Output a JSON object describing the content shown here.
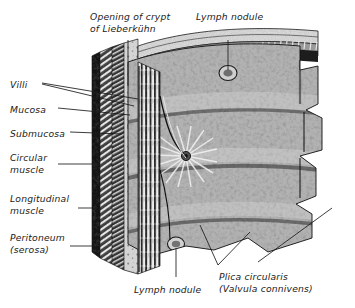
{
  "figure": {
    "kind": "anatomical-illustration",
    "background_color": "#ffffff",
    "ink_color": "#1a1a1a",
    "style": "halftone engraving, grayscale"
  },
  "labels": [
    {
      "id": "opening-of-crypt",
      "lines": [
        "Opening of crypt",
        "of Lieberkühn"
      ],
      "text": "Opening of crypt of Lieberkühn",
      "x": 90,
      "y": 11,
      "align": "left"
    },
    {
      "id": "lymph-nodule-top",
      "lines": [
        "Lymph nodule"
      ],
      "text": "Lymph nodule",
      "x": 196,
      "y": 11,
      "align": "left"
    },
    {
      "id": "villi",
      "lines": [
        "Villi"
      ],
      "text": "Villi",
      "x": 10,
      "y": 79,
      "align": "left"
    },
    {
      "id": "mucosa",
      "lines": [
        "Mucosa"
      ],
      "text": "Mucosa",
      "x": 10,
      "y": 104,
      "align": "left"
    },
    {
      "id": "submucosa",
      "lines": [
        "Submucosa"
      ],
      "text": "Submucosa",
      "x": 10,
      "y": 128,
      "align": "left"
    },
    {
      "id": "circular-muscle",
      "lines": [
        "Circular",
        "muscle"
      ],
      "text": "Circular muscle",
      "x": 10,
      "y": 152,
      "align": "left"
    },
    {
      "id": "longitudinal-muscle",
      "lines": [
        "Longitudinal",
        "muscle"
      ],
      "text": "Longitudinal muscle",
      "x": 10,
      "y": 193,
      "align": "left"
    },
    {
      "id": "peritoneum",
      "lines": [
        "Peritoneum",
        "(serosa)"
      ],
      "text": "Peritoneum (serosa)",
      "x": 10,
      "y": 232,
      "align": "left"
    },
    {
      "id": "lymph-nodule-bottom",
      "lines": [
        "Lymph nodule"
      ],
      "text": "Lymph nodule",
      "x": 134,
      "y": 284,
      "align": "left"
    },
    {
      "id": "plica-circularis",
      "lines": [
        "Plica circularis",
        "(Valvula connivens)"
      ],
      "text": "Plica circularis (Valvula connivens)",
      "x": 219,
      "y": 271,
      "align": "left"
    }
  ],
  "leaders": [
    {
      "id": "leader-opening-of-crypt",
      "points": [
        [
          128,
          40
        ],
        [
          128,
          86
        ]
      ]
    },
    {
      "id": "leader-lymph-nodule-top",
      "points": [
        [
          228,
          40
        ],
        [
          228,
          70
        ]
      ]
    },
    {
      "id": "leader-villi-a",
      "points": [
        [
          42,
          83
        ],
        [
          138,
          99
        ]
      ]
    },
    {
      "id": "leader-villi-b",
      "points": [
        [
          42,
          84
        ],
        [
          134,
          106
        ]
      ]
    },
    {
      "id": "leader-mucosa",
      "points": [
        [
          58,
          108
        ],
        [
          130,
          115
        ]
      ]
    },
    {
      "id": "leader-submucosa",
      "points": [
        [
          70,
          132
        ],
        [
          122,
          134
        ]
      ]
    },
    {
      "id": "leader-circular-muscle",
      "points": [
        [
          58,
          164
        ],
        [
          100,
          164
        ]
      ]
    },
    {
      "id": "leader-longitudinal-muscle",
      "points": [
        [
          78,
          208
        ],
        [
          96,
          208
        ]
      ]
    },
    {
      "id": "leader-peritoneum",
      "points": [
        [
          70,
          246
        ],
        [
          92,
          246
        ]
      ]
    },
    {
      "id": "leader-lymph-nodule-bottom",
      "points": [
        [
          176,
          248
        ],
        [
          176,
          277
        ]
      ]
    },
    {
      "id": "leader-plica-a",
      "points": [
        [
          218,
          265
        ],
        [
          200,
          225
        ]
      ]
    },
    {
      "id": "leader-plica-b",
      "points": [
        [
          218,
          265
        ],
        [
          250,
          232
        ]
      ]
    },
    {
      "id": "leader-plica-c",
      "points": [
        [
          258,
          262
        ],
        [
          332,
          208
        ]
      ]
    }
  ],
  "colors": {
    "ink": "#1a1a1a",
    "background": "#ffffff",
    "tissue_dark": "#2b2b2b",
    "tissue_mid": "#7a7a7a",
    "tissue_light": "#c9c9c9",
    "highlight": "#efefef"
  }
}
